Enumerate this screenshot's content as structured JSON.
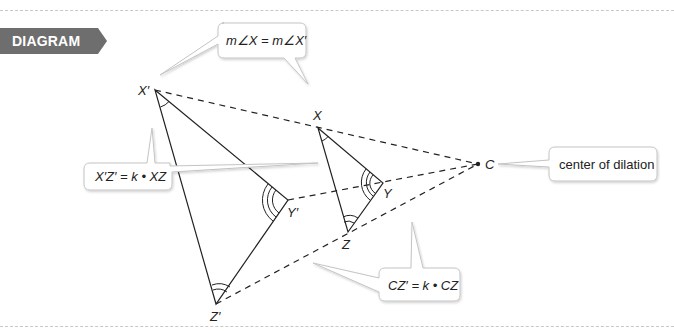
{
  "badge": {
    "label": "DIAGRAM",
    "color": "#6e6e6e"
  },
  "diagram": {
    "type": "dilation",
    "points": {
      "X_prime": {
        "label": "X′",
        "x": 155,
        "y": 90
      },
      "Y_prime": {
        "label": "Y′",
        "x": 288,
        "y": 200
      },
      "Z_prime": {
        "label": "Z′",
        "x": 216,
        "y": 304
      },
      "X": {
        "label": "X",
        "x": 318,
        "y": 128
      },
      "Y": {
        "label": "Y",
        "x": 383,
        "y": 183
      },
      "Z": {
        "label": "Z",
        "x": 348,
        "y": 232
      },
      "C": {
        "label": "C",
        "x": 478,
        "y": 164
      }
    },
    "callouts": {
      "angle_equal": "m∠X = m∠X′",
      "side_scale": "X′Z′ = k • XZ",
      "center": "center of dilation",
      "distance_scale": "CZ′ = k • CZ"
    }
  }
}
